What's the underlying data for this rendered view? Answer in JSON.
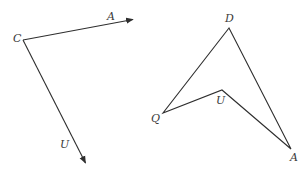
{
  "figure": {
    "left": {
      "description": "Two vectors from point C",
      "vertex": {
        "label": "C",
        "x": 23,
        "y": 40,
        "label_x": 13,
        "label_y": 42
      },
      "vectors": [
        {
          "name": "CA",
          "end_label": "A",
          "from": [
            23,
            40
          ],
          "to": [
            134,
            19
          ],
          "label_x": 107,
          "label_y": 20
        },
        {
          "name": "CU",
          "end_label": "U",
          "from": [
            23,
            40
          ],
          "to": [
            86,
            164
          ],
          "label_x": 60,
          "label_y": 148
        }
      ]
    },
    "right": {
      "description": "Quadrilateral DQUA (concave arrowhead shape)",
      "vertices": [
        {
          "label": "D",
          "x": 229,
          "y": 28,
          "label_x": 225,
          "label_y": 22
        },
        {
          "label": "Q",
          "x": 163,
          "y": 113,
          "label_x": 151,
          "label_y": 122
        },
        {
          "label": "U",
          "x": 222,
          "y": 90,
          "label_x": 216,
          "label_y": 104
        },
        {
          "label": "A",
          "x": 291,
          "y": 149,
          "label_x": 290,
          "label_y": 161
        }
      ]
    },
    "colors": {
      "stroke": "#2e2e2e",
      "text": "#3a3a3a",
      "background": "#ffffff"
    }
  }
}
